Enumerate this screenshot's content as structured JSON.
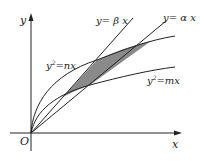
{
  "figure": {
    "axes": {
      "x_label": "x",
      "y_label": "y",
      "origin_label": "O"
    },
    "curves": [
      {
        "id": "line-beta",
        "label": "y= β x",
        "type": "line"
      },
      {
        "id": "line-alpha",
        "label": "y= α x",
        "type": "line"
      },
      {
        "id": "parabola-n",
        "label_base": "y",
        "label_sup": "2",
        "label_rest": "=nx",
        "type": "parabola"
      },
      {
        "id": "parabola-m",
        "label_base": "y",
        "label_sup": "2",
        "label_rest": "=mx",
        "type": "parabola"
      }
    ],
    "shaded_region": {
      "fill": "#8a8a8a",
      "description": "region bounded by y=βx, y=αx, y²=nx, y²=mx"
    },
    "colors": {
      "stroke": "#222222",
      "shade": "#8a8a8a",
      "background": "#ffffff"
    }
  }
}
